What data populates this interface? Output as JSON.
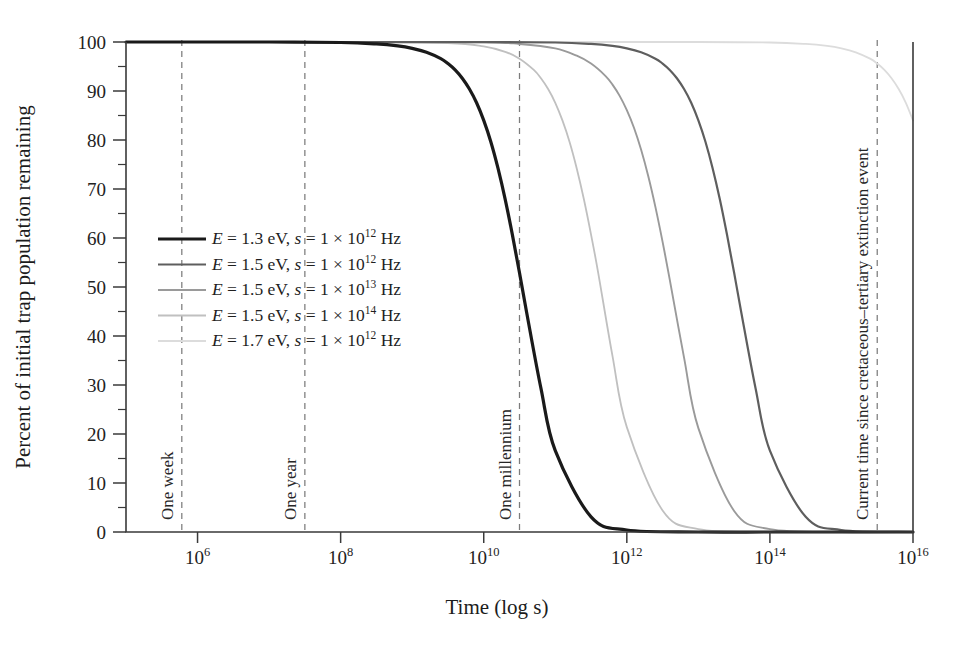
{
  "chart_data": {
    "type": "line",
    "title": "",
    "xlabel": "Time (log s)",
    "ylabel": "Percent of initial trap population remaining",
    "xscale": "log",
    "xlim": [
      100000,
      1e+16
    ],
    "ylim": [
      0,
      100
    ],
    "grid": false,
    "legend_position": "center-left",
    "x_tick_labels": [
      "10^6",
      "10^8",
      "10^10",
      "10^12",
      "10^14",
      "10^16"
    ],
    "x_tick_mantissa": [
      "10",
      "10",
      "10",
      "10",
      "10",
      "10"
    ],
    "x_tick_exponents": [
      "6",
      "8",
      "10",
      "12",
      "14",
      "16"
    ],
    "x_tick_values": [
      1000000.0,
      100000000.0,
      10000000000.0,
      1000000000000.0,
      100000000000000.0,
      1e+16
    ],
    "y_tick_labels": [
      "0",
      "10",
      "20",
      "30",
      "40",
      "50",
      "60",
      "70",
      "80",
      "90",
      "100"
    ],
    "y_tick_values": [
      0,
      10,
      20,
      30,
      40,
      50,
      60,
      70,
      80,
      90,
      100
    ],
    "y_minor_tick_values": [
      5,
      15,
      25,
      35,
      45,
      55,
      65,
      75,
      85,
      95
    ],
    "series": [
      {
        "name": "E = 1.3 eV, s = 1 × 10^12 Hz",
        "energy_eV": 1.3,
        "frequency_Hz": 1000000000000.0,
        "color": "#1a1a1a",
        "width": 3.2,
        "half_life_s": 3200000000.0,
        "points_log10_t": [
          5.0,
          6.0,
          7.0,
          8.0,
          8.5,
          8.8,
          9.0,
          9.2,
          9.4,
          9.5,
          9.6,
          9.7,
          9.8,
          9.9,
          10.0,
          10.1,
          10.2,
          10.3,
          10.4,
          10.5,
          10.6,
          10.8,
          11.0,
          11.5,
          12.0,
          13.0,
          14.0,
          15.0,
          16.0
        ],
        "points_percent": [
          100.0,
          100.0,
          100.0,
          99.9,
          99.6,
          99.2,
          98.7,
          97.9,
          96.6,
          95.6,
          94.3,
          92.6,
          90.4,
          87.6,
          84.0,
          79.6,
          74.2,
          67.9,
          60.7,
          52.9,
          44.8,
          29.3,
          16.6,
          3.1,
          0.4,
          0.0,
          0.0,
          0.0,
          0.0
        ]
      },
      {
        "name": "E = 1.5 eV, s = 1 × 10^12 Hz",
        "energy_eV": 1.5,
        "frequency_Hz": 1000000000000.0,
        "color": "#5e5e5e",
        "width": 2.2,
        "half_life_s": 6800000000000.0,
        "points_log10_t": [
          5.0,
          8.0,
          10.0,
          11.0,
          11.5,
          11.8,
          12.0,
          12.2,
          12.4,
          12.5,
          12.6,
          12.7,
          12.8,
          12.9,
          13.0,
          13.1,
          13.2,
          13.3,
          13.4,
          13.5,
          13.6,
          13.8,
          14.0,
          14.5,
          15.0,
          16.0
        ],
        "points_percent": [
          100.0,
          100.0,
          100.0,
          99.9,
          99.6,
          99.2,
          98.7,
          97.9,
          96.6,
          95.6,
          94.3,
          92.6,
          90.4,
          87.6,
          84.0,
          79.6,
          74.2,
          67.9,
          60.7,
          52.9,
          44.8,
          29.3,
          16.6,
          3.1,
          0.4,
          0.0
        ]
      },
      {
        "name": "E = 1.5 eV, s = 1 × 10^13 Hz",
        "energy_eV": 1.5,
        "frequency_Hz": 10000000000000.0,
        "color": "#9a9a9a",
        "width": 1.9,
        "half_life_s": 680000000000.0,
        "points_log10_t": [
          5.0,
          8.0,
          10.0,
          10.5,
          11.0,
          11.3,
          11.5,
          11.7,
          11.8,
          11.9,
          12.0,
          12.1,
          12.2,
          12.3,
          12.4,
          12.5,
          12.6,
          12.8,
          13.0,
          13.5,
          14.0,
          15.0,
          16.0
        ],
        "points_percent": [
          100.0,
          100.0,
          99.9,
          99.6,
          98.7,
          97.2,
          95.6,
          93.1,
          91.3,
          89.0,
          86.1,
          82.5,
          78.0,
          72.6,
          66.3,
          59.2,
          51.5,
          35.6,
          21.2,
          4.3,
          0.6,
          0.0,
          0.0
        ]
      },
      {
        "name": "E = 1.5 eV, s = 1 × 10^14 Hz",
        "energy_eV": 1.5,
        "frequency_Hz": 100000000000000.0,
        "color": "#c0c0c0",
        "width": 1.8,
        "half_life_s": 68000000000.0,
        "points_log10_t": [
          5.0,
          8.0,
          9.5,
          10.0,
          10.3,
          10.5,
          10.7,
          10.8,
          10.9,
          11.0,
          11.1,
          11.2,
          11.3,
          11.4,
          11.5,
          11.6,
          11.8,
          12.0,
          12.5,
          13.0,
          14.0,
          15.0,
          16.0
        ],
        "points_percent": [
          100.0,
          100.0,
          99.8,
          99.1,
          98.0,
          96.6,
          94.3,
          92.6,
          90.4,
          87.6,
          84.0,
          79.6,
          74.2,
          67.9,
          60.7,
          52.9,
          35.9,
          21.4,
          4.4,
          0.6,
          0.0,
          0.0,
          0.0
        ]
      },
      {
        "name": "E = 1.7 eV, s = 1 × 10^12 Hz",
        "energy_eV": 1.7,
        "frequency_Hz": 1000000000000.0,
        "color": "#dcdcdc",
        "width": 1.8,
        "half_life_s": 1.4e+16,
        "points_log10_t": [
          5.0,
          10.0,
          13.0,
          14.0,
          14.5,
          14.8,
          15.0,
          15.2,
          15.4,
          15.5,
          15.6,
          15.7,
          15.8,
          15.9,
          16.0
        ],
        "points_percent": [
          100.0,
          100.0,
          100.0,
          99.9,
          99.6,
          99.2,
          98.7,
          97.9,
          96.6,
          95.6,
          94.3,
          92.6,
          90.4,
          87.6,
          84.0
        ]
      }
    ],
    "annotations": [
      {
        "label": "One week",
        "log10_t": 5.78,
        "value_s": 604800
      },
      {
        "label": "One year",
        "log10_t": 7.5,
        "value_s": 31557600
      },
      {
        "label": "One millennium",
        "log10_t": 10.5,
        "value_s": 31557600000
      },
      {
        "label": "Current time since cretaceous–tertiary extinction event",
        "log10_t": 15.5,
        "value_s": 2100000000000000.0
      }
    ]
  },
  "legend": {
    "entries": [
      {
        "prefix": "E",
        "mid": " = 1.3 eV, ",
        "s_italic": "s",
        "tail": " = 1 × 10",
        "exp": "12",
        "unit": " Hz"
      },
      {
        "prefix": "E",
        "mid": " = 1.5 eV, ",
        "s_italic": "s",
        "tail": " = 1 × 10",
        "exp": "12",
        "unit": " Hz"
      },
      {
        "prefix": "E",
        "mid": " = 1.5 eV, ",
        "s_italic": "s",
        "tail": " = 1 × 10",
        "exp": "13",
        "unit": " Hz"
      },
      {
        "prefix": "E",
        "mid": " = 1.5 eV, ",
        "s_italic": "s",
        "tail": " = 1 × 10",
        "exp": "14",
        "unit": " Hz"
      },
      {
        "prefix": "E",
        "mid": " = 1.7 eV, ",
        "s_italic": "s",
        "tail": " = 1 × 10",
        "exp": "12",
        "unit": " Hz"
      }
    ]
  },
  "colors": {
    "axis": "#3a3a3a",
    "text": "#1c1c1c",
    "dashed": "#7c7c7c",
    "background": "#ffffff"
  }
}
